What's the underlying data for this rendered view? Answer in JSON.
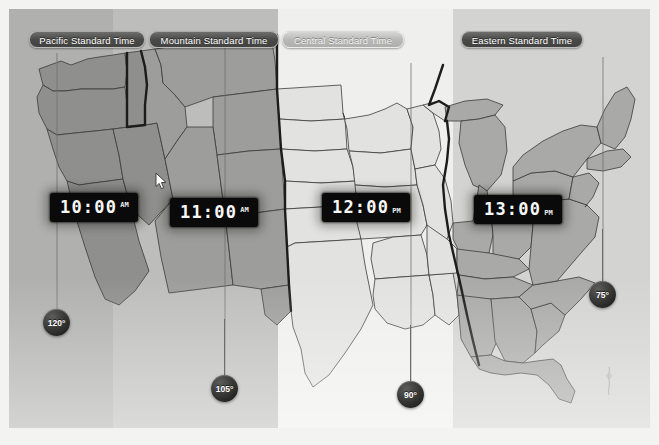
{
  "app": {
    "title": "United States Time Zone Map",
    "frame_color": "#f3f3f1"
  },
  "timezone_bands": [
    {
      "id": "pacific",
      "label": "Pacific Standard Time",
      "style": "dark",
      "band_color": "#b0b0ae",
      "selected": false
    },
    {
      "id": "mountain",
      "label": "Mountain Standard Time",
      "style": "dark",
      "band_color": "#bdbdbb",
      "selected": false
    },
    {
      "id": "central",
      "label": "Central Standard Time",
      "style": "light",
      "band_color": "#efefed",
      "selected": true
    },
    {
      "id": "eastern",
      "label": "Eastern Standard Time",
      "style": "dark",
      "band_color": "#d3d3d1",
      "selected": false
    }
  ],
  "clocks": [
    {
      "id": "pacific",
      "time": "10:00",
      "meridiem": "AM",
      "position": "sup"
    },
    {
      "id": "mountain",
      "time": "11:00",
      "meridiem": "AM",
      "position": "sup"
    },
    {
      "id": "central",
      "time": "12:00",
      "meridiem": "PM",
      "position": "sub"
    },
    {
      "id": "eastern",
      "time": "13:00",
      "meridiem": "PM",
      "position": "sub"
    }
  ],
  "longitude_markers": [
    {
      "id": "lon-120",
      "label": "120°"
    },
    {
      "id": "lon-105",
      "label": "105°"
    },
    {
      "id": "lon-90",
      "label": "90°"
    },
    {
      "id": "lon-75",
      "label": "75°"
    }
  ],
  "colors": {
    "map_land_pacific": "#8f8f8d",
    "map_land_mountain": "#9d9d9b",
    "map_land_central": "#e2e2e0",
    "map_land_eastern": "#a9a9a7",
    "state_border": "#3b3b3b",
    "zone_border": "#1c1c1c",
    "clock_background": "#0a0a0a",
    "clock_text": "#f7f7f7",
    "pin_bubble": "#141414"
  },
  "cursor": {
    "name": "arrow-pointer",
    "x": 146,
    "y": 163
  }
}
